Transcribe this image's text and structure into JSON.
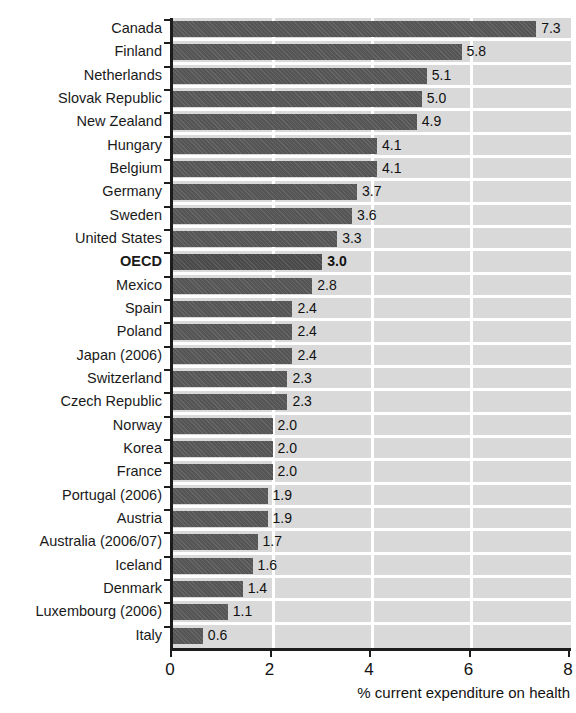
{
  "chart_data": {
    "type": "bar",
    "orientation": "horizontal",
    "title": "",
    "xlabel": "% current expenditure on health",
    "ylabel": "",
    "xlim": [
      0,
      8
    ],
    "xticks": [
      "0",
      "2",
      "4",
      "6",
      "8"
    ],
    "grid": "vertical white gridlines at 2, 4, 6",
    "legend": "none",
    "highlight_category": "OECD",
    "categories": [
      "Canada",
      "Finland",
      "Netherlands",
      "Slovak Republic",
      "New Zealand",
      "Hungary",
      "Belgium",
      "Germany",
      "Sweden",
      "United States",
      "OECD",
      "Mexico",
      "Spain",
      "Poland",
      "Japan (2006)",
      "Switzerland",
      "Czech Republic",
      "Norway",
      "Korea",
      "France",
      "Portugal (2006)",
      "Austria",
      "Australia (2006/07)",
      "Iceland",
      "Denmark",
      "Luxembourg (2006)",
      "Italy"
    ],
    "values": [
      7.3,
      5.8,
      5.1,
      5.0,
      4.9,
      4.1,
      4.1,
      3.7,
      3.6,
      3.3,
      3.0,
      2.8,
      2.4,
      2.4,
      2.4,
      2.3,
      2.3,
      2.0,
      2.0,
      2.0,
      1.9,
      1.9,
      1.7,
      1.6,
      1.4,
      1.1,
      0.6
    ],
    "value_labels": [
      "7.3",
      "5.8",
      "5.1",
      "5.0",
      "4.9",
      "4.1",
      "4.1",
      "3.7",
      "3.6",
      "3.3",
      "3.0",
      "2.8",
      "2.4",
      "2.4",
      "2.4",
      "2.3",
      "2.3",
      "2.0",
      "2.0",
      "2.0",
      "1.9",
      "1.9",
      "1.7",
      "1.6",
      "1.4",
      "1.1",
      "0.6"
    ],
    "colors": {
      "bar": "#555555",
      "bar_highlight": "#4a4a4a",
      "plot_background": "#d9d9d9",
      "gridline": "#ffffff",
      "axis": "#1c1c1c",
      "text": "#111111"
    }
  }
}
